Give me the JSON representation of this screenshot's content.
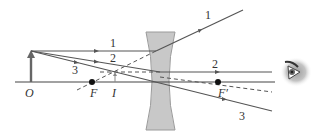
{
  "colors": {
    "ray": "#555555",
    "axis": "#444444",
    "lens_fill": "#c8c8c8",
    "lens_stroke": "#9a9a9a",
    "object_arrow": "#666666",
    "focal_point": "#111111",
    "label": "#333333"
  },
  "labels": {
    "object": "O",
    "image": "I",
    "focal_left": "F",
    "focal_right": "F′",
    "ray1_left": "1",
    "ray1_right": "1",
    "ray2_left": "2",
    "ray2_right": "2",
    "ray3_left": "3",
    "ray3_right": "3"
  },
  "geometry": {
    "optical_axis": {
      "x1": 15,
      "x2": 275,
      "y": 82
    },
    "object": {
      "x": 31,
      "base_y": 82,
      "tip_y": 51
    },
    "image": {
      "x": 115,
      "base_y": 82,
      "tip_y": 72
    },
    "lens": {
      "center_x": 160,
      "top_y": 32,
      "bottom_y": 130
    },
    "focal_left": {
      "x": 92,
      "y": 82
    },
    "focal_right": {
      "x": 218,
      "y": 82
    }
  },
  "eye_icon": "eye-icon"
}
